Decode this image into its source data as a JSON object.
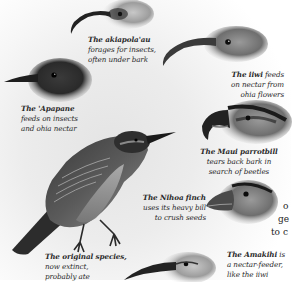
{
  "captions": {
    "akiapolaau": {
      "name": "The akiapola'au",
      "lines": [
        "forages for insects,",
        "often under bark"
      ]
    },
    "iiwi": {
      "name": "The iiwi",
      "first_rest": " feeds",
      "lines": [
        "on nectar from",
        "ohia flowers"
      ]
    },
    "apapane": {
      "name": "The 'Apapane",
      "lines": [
        "feeds on insects",
        "and ohia nectar"
      ]
    },
    "maui_parrotbill": {
      "name": "The Maui parrotbill",
      "lines": [
        "tears back bark in",
        "search of beetles"
      ]
    },
    "nihoa_finch": {
      "name": "The Nihoa finch",
      "lines": [
        "uses its heavy bill",
        "to crush seeds"
      ]
    },
    "original_species": {
      "name": "The original species,",
      "lines": [
        "now extinct,",
        "probably ate"
      ]
    },
    "amakihi": {
      "name": "The Amakihi",
      "first_rest": " is",
      "lines": [
        "a nectar-feeder,",
        "like the iiwi"
      ]
    }
  },
  "cut_text": {
    "lines": [
      "o",
      "ge",
      "to c"
    ]
  },
  "illustrations": [
    "akiapolaau-head",
    "iiwi-head",
    "apapane-head",
    "maui-parrotbill-head",
    "ancestral-finch-body",
    "nihoa-finch-head",
    "amakihi-head"
  ]
}
